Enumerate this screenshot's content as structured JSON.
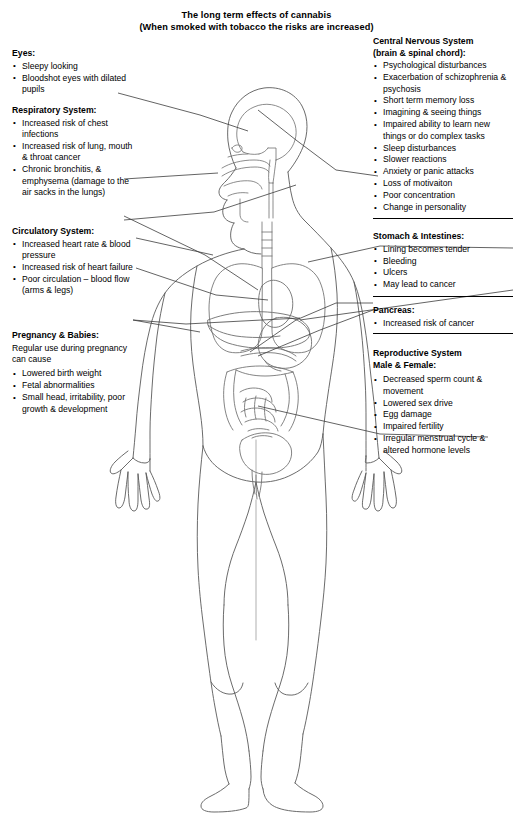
{
  "title": {
    "line1": "The long term effects of cannabis",
    "line2": "(When smoked with tobacco the risks are increased)"
  },
  "colors": {
    "outline": "#5a5a5a",
    "organ": "#6e6e6e",
    "leader": "#3c3c3c",
    "text": "#000000",
    "background": "#ffffff"
  },
  "diagram": {
    "regions": [
      "brain",
      "nasal-cavity",
      "mouth",
      "trachea",
      "lungs",
      "heart",
      "liver",
      "stomach",
      "pancreas",
      "intestines",
      "bladder",
      "reproductive-organs",
      "arms",
      "hands",
      "legs",
      "feet"
    ]
  },
  "left_column": {
    "eyes": {
      "heading": "Eyes:",
      "items": [
        "Sleepy looking",
        "Bloodshot eyes with dilated pupils"
      ]
    },
    "respiratory": {
      "heading": "Respiratory System:",
      "items": [
        "Increased risk of chest infections",
        "Increased risk of lung, mouth & throat cancer",
        "Chronic bronchitis, & emphysema (damage to the air sacks in the lungs)"
      ]
    },
    "circulatory": {
      "heading": "Circulatory System:",
      "items": [
        "Increased heart rate & blood pressure",
        "Increased risk of heart failure",
        "Poor circulation – blood flow (arms & legs)"
      ]
    },
    "pregnancy": {
      "heading": "Pregnancy & Babies:",
      "intro": "Regular use during pregnancy can cause",
      "items": [
        "Lowered birth weight",
        "Fetal abnormalities",
        "Small head, irritability, poor growth & development"
      ]
    }
  },
  "right_column": {
    "cns": {
      "heading": "Central Nervous System\n(brain & spinal chord):",
      "items": [
        "Psychological disturbances",
        "Exacerbation of schizophrenia & psychosis",
        "Short term memory loss",
        "Imagining & seeing things",
        "Impaired ability to learn new things or do complex tasks",
        "Sleep disturbances",
        "Slower reactions",
        "Anxiety or panic attacks",
        "Loss of motivaiton",
        "Poor concentration",
        "Change in personality"
      ]
    },
    "stomach": {
      "heading": "Stomach & Intestines:",
      "items": [
        "Lining becomes tender",
        "Bleeding",
        "Ulcers",
        "May lead to cancer"
      ]
    },
    "pancreas": {
      "heading": "Pancreas:",
      "items": [
        "Increased risk of cancer"
      ]
    },
    "reproductive": {
      "heading": "Reproductive System\nMale & Female:",
      "items": [
        "Decreased sperm count & movement",
        "Lowered sex drive",
        "Egg damage",
        "Impaired fertility",
        "Irregular menstrual cycle & altered hormone levels"
      ]
    }
  }
}
